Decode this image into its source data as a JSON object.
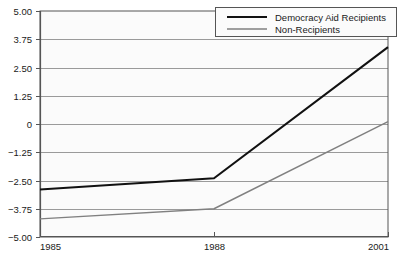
{
  "chart_data": {
    "type": "line",
    "title": "",
    "subtitle": "",
    "xlabel": "",
    "ylabel": "",
    "x": [
      1985,
      1988,
      2001
    ],
    "x_tick_labels": [
      "1985",
      "1988",
      "2001"
    ],
    "xlim": [
      1985,
      2001
    ],
    "y_tick_labels": [
      "5.00",
      "3.75",
      "2.50",
      "1.25",
      "0",
      "-1.25",
      "-2.50",
      "-3.75",
      "-5.00"
    ],
    "y_ticks": [
      5.0,
      3.75,
      2.5,
      1.25,
      0,
      -1.25,
      -2.5,
      -3.75,
      -5.0
    ],
    "ylim": [
      -5.0,
      5.0
    ],
    "grid": true,
    "legend_position": "top-right",
    "series": [
      {
        "name": "Democracy Aid Recipients",
        "values": [
          -2.9,
          -2.4,
          3.4
        ],
        "color": "#111111",
        "width": 2.1
      },
      {
        "name": "Non-Recipients",
        "values": [
          -4.2,
          -3.75,
          0.1
        ],
        "color": "#808080",
        "width": 1.4
      }
    ]
  },
  "axes": {
    "axis_color": "#6e6e6e",
    "grid_color": "#9a9a9a",
    "plot_background": "#fbfbfb",
    "border_color": "#555555"
  },
  "legend": {
    "entries": [
      {
        "label": "Democracy Aid Recipients"
      },
      {
        "label": "Non-Recipients"
      }
    ]
  }
}
